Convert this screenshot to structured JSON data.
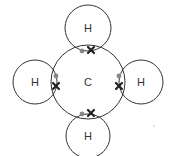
{
  "diagram": {
    "central_atom": {
      "symbol": "C",
      "cx": 88,
      "cy": 82,
      "r": 37
    },
    "hydrogens": [
      {
        "id": "top",
        "symbol": "H",
        "cx": 88,
        "cy": 28,
        "r": 23
      },
      {
        "id": "left",
        "symbol": "H",
        "cx": 35,
        "cy": 82,
        "r": 22
      },
      {
        "id": "right",
        "symbol": "H",
        "cx": 141,
        "cy": 82,
        "r": 22
      },
      {
        "id": "bottom",
        "symbol": "H",
        "cx": 88,
        "cy": 136,
        "r": 22
      }
    ],
    "bond_pairs": [
      {
        "id": "top",
        "dot": [
          82,
          51
        ],
        "cross": [
          91,
          50
        ]
      },
      {
        "id": "left",
        "dot": [
          56,
          76
        ],
        "cross": [
          56,
          86
        ]
      },
      {
        "id": "right",
        "dot": [
          119,
          76
        ],
        "cross": [
          119,
          86
        ]
      },
      {
        "id": "bottom",
        "dot": [
          82,
          114
        ],
        "cross": [
          91,
          113
        ]
      }
    ],
    "colors": {
      "outline": "#333333",
      "dot": "#888888",
      "cross": "#222222",
      "text": "#333333"
    }
  }
}
